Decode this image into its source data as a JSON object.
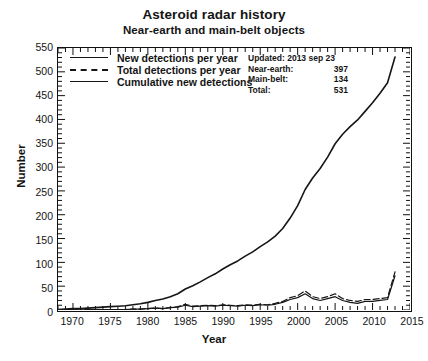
{
  "titles": {
    "main": "Asteroid radar history",
    "sub": "Near-earth and main-belt objects"
  },
  "axes": {
    "xlabel": "Year",
    "ylabel": "Number"
  },
  "legend": [
    {
      "label": "New detections per year",
      "style": "solid",
      "color": "#151515"
    },
    {
      "label": "Total detections per year",
      "style": "dashed",
      "color": "#151515"
    },
    {
      "label": "Cumulative new detections",
      "style": "solid",
      "color": "#151515"
    }
  ],
  "info": {
    "updated_label": "Updated: 2013 sep 23",
    "rows": [
      {
        "key": "Near-earth:",
        "value": "397"
      },
      {
        "key": "Main-belt:",
        "value": "134"
      },
      {
        "key": "Total:",
        "value": "531"
      }
    ]
  },
  "chart_data": {
    "type": "line",
    "title": "Asteroid radar history",
    "subtitle": "Near-earth and main-belt objects",
    "xlabel": "Year",
    "ylabel": "Number",
    "xlim": [
      1968,
      2015
    ],
    "ylim": [
      0,
      550
    ],
    "xticks": [
      1970,
      1975,
      1980,
      1985,
      1990,
      1995,
      2000,
      2005,
      2010,
      2015
    ],
    "yticks": [
      0,
      50,
      100,
      150,
      200,
      250,
      300,
      350,
      400,
      450,
      500,
      550
    ],
    "x_minor_tick_step": 1,
    "y_minor_tick_step": 10,
    "grid": false,
    "legend_position": "upper-left-inside",
    "x": [
      1968,
      1969,
      1970,
      1971,
      1972,
      1973,
      1974,
      1975,
      1976,
      1977,
      1978,
      1979,
      1980,
      1981,
      1982,
      1983,
      1984,
      1985,
      1986,
      1987,
      1988,
      1989,
      1990,
      1991,
      1992,
      1993,
      1994,
      1995,
      1996,
      1997,
      1998,
      1999,
      2000,
      2001,
      2002,
      2003,
      2004,
      2005,
      2006,
      2007,
      2008,
      2009,
      2010,
      2011,
      2012,
      2013
    ],
    "series": [
      {
        "name": "New detections per year",
        "style": "solid",
        "values": [
          1,
          1,
          1,
          0,
          1,
          1,
          1,
          1,
          1,
          1,
          2,
          2,
          3,
          4,
          3,
          5,
          6,
          10,
          7,
          8,
          9,
          8,
          10,
          9,
          8,
          10,
          9,
          11,
          10,
          12,
          16,
          22,
          26,
          34,
          24,
          20,
          24,
          28,
          20,
          16,
          14,
          18,
          18,
          20,
          22,
          72
        ]
      },
      {
        "name": "Total detections per year",
        "style": "dashed",
        "values": [
          1,
          1,
          1,
          0,
          1,
          1,
          1,
          1,
          1,
          1,
          2,
          2,
          3,
          4,
          3,
          5,
          7,
          12,
          8,
          9,
          10,
          9,
          11,
          10,
          9,
          11,
          10,
          12,
          11,
          14,
          18,
          26,
          30,
          40,
          28,
          24,
          28,
          34,
          24,
          20,
          18,
          22,
          22,
          24,
          26,
          80
        ]
      },
      {
        "name": "Cumulative new detections",
        "style": "solid",
        "values": [
          1,
          2,
          3,
          3,
          4,
          5,
          6,
          7,
          8,
          9,
          11,
          13,
          16,
          20,
          23,
          28,
          34,
          44,
          51,
          59,
          68,
          76,
          86,
          95,
          103,
          113,
          122,
          133,
          143,
          155,
          171,
          193,
          219,
          253,
          277,
          297,
          321,
          349,
          369,
          385,
          399,
          417,
          435,
          455,
          477,
          531
        ]
      }
    ],
    "annotations": {
      "updated": "Updated: 2013 sep 23",
      "near_earth": 397,
      "main_belt": 134,
      "total": 531
    }
  }
}
